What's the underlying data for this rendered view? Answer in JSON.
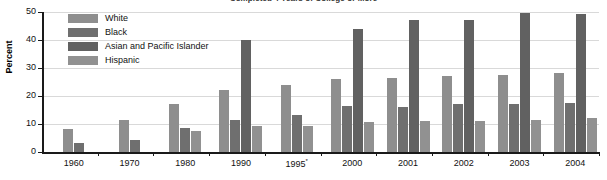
{
  "chart_data": {
    "type": "bar",
    "title": "Completed 4 Years of College or More",
    "xlabel": "",
    "ylabel": "Percent",
    "ylim": [
      0,
      50
    ],
    "yticks": [
      0,
      10,
      20,
      30,
      40,
      50
    ],
    "grid": true,
    "legend_position": "top-left",
    "categories": [
      "1960",
      "1970",
      "1980",
      "1990",
      "1995*",
      "2000",
      "2001",
      "2002",
      "2003",
      "2004"
    ],
    "category_labels_display": [
      "1960",
      "1970",
      "1980",
      "1990",
      "1995",
      "2000",
      "2001",
      "2002",
      "2003",
      "2004"
    ],
    "footnote_marker": "*",
    "series": [
      {
        "name": "White",
        "color": "#8e8e8e",
        "values": [
          8.1,
          11.3,
          17.1,
          22.0,
          24.0,
          26.1,
          26.6,
          27.2,
          27.6,
          28.2
        ]
      },
      {
        "name": "Black",
        "color": "#6f6f6f",
        "values": [
          3.1,
          4.4,
          8.4,
          11.3,
          13.2,
          16.5,
          16.0,
          17.2,
          17.3,
          17.6
        ]
      },
      {
        "name": "Asian and Pacific Islander",
        "color": "#616161",
        "values": [
          null,
          null,
          null,
          39.9,
          null,
          43.9,
          47.2,
          47.2,
          49.7,
          49.4
        ]
      },
      {
        "name": "Hispanic",
        "color": "#919191",
        "values": [
          null,
          null,
          7.6,
          9.2,
          9.3,
          10.6,
          11.1,
          11.1,
          11.4,
          12.1
        ]
      }
    ]
  }
}
